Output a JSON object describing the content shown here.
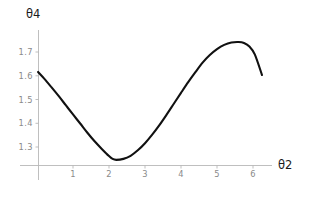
{
  "chart_data": {
    "type": "line",
    "title": "",
    "subtitle": "",
    "xlabel": "θ2",
    "ylabel": "θ4",
    "xlim": [
      0.03,
      6.6
    ],
    "ylim": [
      1.227,
      1.755
    ],
    "grid": false,
    "legend": null,
    "xticks": [
      1,
      2,
      3,
      4,
      5,
      6
    ],
    "xtick_labels": [
      "1",
      "2",
      "3",
      "4",
      "5",
      "6"
    ],
    "yticks": [
      1.3,
      1.4,
      1.5,
      1.6,
      1.7
    ],
    "ytick_labels": [
      "1.3",
      "1.4",
      "1.5",
      "1.6",
      "1.7"
    ],
    "series": [
      {
        "name": "theta4",
        "color": "#111111",
        "x": [
          0.03,
          0.2,
          0.4,
          0.6,
          0.8,
          1.0,
          1.2,
          1.4,
          1.6,
          1.8,
          2.0,
          2.1,
          2.2,
          2.4,
          2.6,
          2.8,
          3.0,
          3.2,
          3.4,
          3.6,
          3.8,
          4.0,
          4.2,
          4.4,
          4.6,
          4.8,
          5.0,
          5.2,
          5.4,
          5.6,
          5.75,
          5.9,
          6.05,
          6.25
        ],
        "y": [
          1.616,
          1.588,
          1.552,
          1.515,
          1.476,
          1.437,
          1.399,
          1.36,
          1.324,
          1.292,
          1.262,
          1.25,
          1.246,
          1.25,
          1.263,
          1.286,
          1.316,
          1.352,
          1.392,
          1.436,
          1.482,
          1.528,
          1.573,
          1.615,
          1.655,
          1.687,
          1.712,
          1.73,
          1.74,
          1.742,
          1.738,
          1.723,
          1.69,
          1.603
        ]
      }
    ],
    "annotations": []
  },
  "axes": {
    "x_axis_name": "theta2-axis",
    "y_axis_name": "theta4-axis",
    "x_title": "θ2",
    "y_title": "θ4"
  }
}
